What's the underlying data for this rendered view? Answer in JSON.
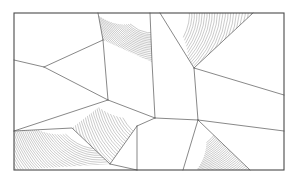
{
  "figure": {
    "canvas": {
      "width": 296,
      "height": 182,
      "background": "#ffffff"
    },
    "frame": {
      "name": "outer-border",
      "x": 14,
      "y": 13,
      "width": 270,
      "height": 157,
      "stroke": "#4a4a4a",
      "stroke_width": 1.1,
      "fill": "none"
    },
    "style": {
      "edge_color": "#555555",
      "edge_width": 0.7,
      "hatch_color": "#6e6e6e",
      "hatch_width": 0.36,
      "face_color": "#ffffff"
    },
    "vertices": {
      "tl": [
        14,
        13
      ],
      "tr": [
        284,
        13
      ],
      "br": [
        284,
        170
      ],
      "bl": [
        14,
        170
      ],
      "top_a": [
        98,
        13
      ],
      "top_b": [
        150,
        13
      ],
      "top_c": [
        160,
        13
      ],
      "top_d": [
        253,
        13
      ],
      "right_a": [
        284,
        95
      ],
      "right_b": [
        284,
        131
      ],
      "bottom_a": [
        137,
        170
      ],
      "bottom_b": [
        183,
        170
      ],
      "bottom_c": [
        250,
        170
      ],
      "left_a": [
        14,
        60
      ],
      "left_b": [
        14,
        131
      ],
      "j_left": [
        44,
        67
      ],
      "j_mid_top": [
        103,
        40
      ],
      "j_mid": [
        108,
        100
      ],
      "j_center": [
        155,
        118
      ],
      "j_apex": [
        194,
        68
      ],
      "j_lower": [
        198,
        120
      ],
      "j_quad": [
        137,
        126
      ],
      "j_hatchq": [
        110,
        164
      ]
    },
    "cells": [
      {
        "id": "cell-upper-left",
        "name": "polygon-upper-left",
        "points": "14,13 98,13 103,40 44,67 14,60",
        "hatched": false,
        "label": "upper-left quad"
      },
      {
        "id": "cell-left-wedge",
        "name": "polygon-left-wedge",
        "points": "14,60 44,67 108,100 14,131",
        "hatched": false,
        "label": "left wedge"
      },
      {
        "id": "cell-fan-top",
        "name": "polygon-fan-top",
        "points": "98,13 150,13 152,62 103,40",
        "hatched": true,
        "hatch": {
          "style": "curved-fan",
          "pivot": [
            150,
            13
          ],
          "lines": 46,
          "spread": 1.0
        },
        "label": "top fan hatch"
      },
      {
        "id": "cell-mid-column",
        "name": "polygon-mid-column",
        "points": "103,40 152,62 155,118 108,100",
        "hatched": false,
        "label": "middle column"
      },
      {
        "id": "cell-top-triangle",
        "name": "polygon-top-triangle",
        "points": "160,13 253,13 194,68",
        "hatched": true,
        "hatch": {
          "style": "curved-fan",
          "pivot": [
            160,
            13
          ],
          "lines": 44,
          "spread": 1.0
        },
        "label": "top-right hatched triangle"
      },
      {
        "id": "cell-narrow-spike",
        "name": "polygon-narrow-spike",
        "points": "150,13 160,13 194,68 198,120 155,118 152,62",
        "hatched": false,
        "label": "central narrow spike"
      },
      {
        "id": "cell-right-upper",
        "name": "polygon-right-upper",
        "points": "253,13 284,13 284,95 194,68",
        "hatched": false,
        "label": "right upper band"
      },
      {
        "id": "cell-right-mid",
        "name": "polygon-right-mid",
        "points": "194,68 284,95 284,131 198,120",
        "hatched": false,
        "label": "right middle band"
      },
      {
        "id": "cell-mid-hatch",
        "name": "polygon-mid-hatch",
        "points": "108,100 155,118 137,126 110,164 72,128",
        "hatched": true,
        "hatch": {
          "style": "curved-fan",
          "pivot": [
            155,
            112
          ],
          "lines": 42,
          "spread": 1.0
        },
        "label": "central-left hatched patch"
      },
      {
        "id": "cell-bottom-left-hatch",
        "name": "polygon-bottom-left-hatch",
        "points": "14,131 72,128 110,164 14,170",
        "hatched": true,
        "hatch": {
          "style": "curved-fan",
          "pivot": [
            95,
            120
          ],
          "lines": 50,
          "spread": 1.0
        },
        "label": "bottom-left hatched quad"
      },
      {
        "id": "cell-bottom-mid",
        "name": "polygon-bottom-mid",
        "points": "110,164 137,126 137,170",
        "hatched": false,
        "label": "bottom small triangle"
      },
      {
        "id": "cell-bottom-center",
        "name": "polygon-bottom-center",
        "points": "137,126 155,118 198,120 183,170 137,170",
        "hatched": false,
        "label": "bottom center cell"
      },
      {
        "id": "cell-bottom-right-hatch",
        "name": "polygon-bottom-right-hatch",
        "points": "198,120 250,170 183,170",
        "hatched": true,
        "hatch": {
          "style": "curved-fan",
          "pivot": [
            198,
            118
          ],
          "lines": 48,
          "spread": 1.0
        },
        "label": "bottom-right hatched quad"
      },
      {
        "id": "cell-bottom-right-corner",
        "name": "polygon-bottom-right-corner",
        "points": "198,120 284,131 284,170 250,170",
        "hatched": false,
        "label": "bottom-right corner cell"
      }
    ],
    "edges": [
      {
        "name": "edge-top-a-to-jmidtop",
        "d": "M 98,13 L 103,40"
      },
      {
        "name": "edge-jmidtop-to-jleft",
        "d": "M 103,40 L 44,67"
      },
      {
        "name": "edge-jleft-to-left-a",
        "d": "M 44,67 L 14,60"
      },
      {
        "name": "edge-jleft-to-jmid",
        "d": "M 44,67 L 108,100"
      },
      {
        "name": "edge-jmid-to-left-b",
        "d": "M 108,100 L 14,131"
      },
      {
        "name": "edge-top-b-down",
        "d": "M 150,13 L 152,62 L 155,118"
      },
      {
        "name": "edge-jmidtop-to-jmid",
        "d": "M 103,40 L 108,100"
      },
      {
        "name": "edge-top-c-to-apex",
        "d": "M 160,13 L 194,68"
      },
      {
        "name": "edge-top-d-to-apex",
        "d": "M 253,13 L 194,68"
      },
      {
        "name": "edge-apex-to-right-a",
        "d": "M 194,68 L 284,95"
      },
      {
        "name": "edge-apex-to-jlower",
        "d": "M 194,68 L 198,120"
      },
      {
        "name": "edge-jlower-to-right-b",
        "d": "M 198,120 L 284,131"
      },
      {
        "name": "edge-jcenter-to-jlower",
        "d": "M 155,118 L 198,120"
      },
      {
        "name": "edge-jmid-to-jcenter",
        "d": "M 108,100 L 155,118"
      },
      {
        "name": "edge-jcenter-to-jquad",
        "d": "M 155,118 L 137,126"
      },
      {
        "name": "edge-jquad-to-hatchq",
        "d": "M 137,126 L 110,164"
      },
      {
        "name": "edge-jquad-to-bottom-a",
        "d": "M 137,126 L 137,170"
      },
      {
        "name": "edge-hatchq-to-leftb",
        "d": "M 110,164 L 72,128 L 14,131"
      },
      {
        "name": "edge-hatchq-to-bottom-a",
        "d": "M 110,164 L 137,170"
      },
      {
        "name": "edge-jlower-to-bottom-b",
        "d": "M 198,120 L 183,170"
      },
      {
        "name": "edge-jlower-to-bottom-c",
        "d": "M 198,120 L 250,170"
      }
    ]
  }
}
